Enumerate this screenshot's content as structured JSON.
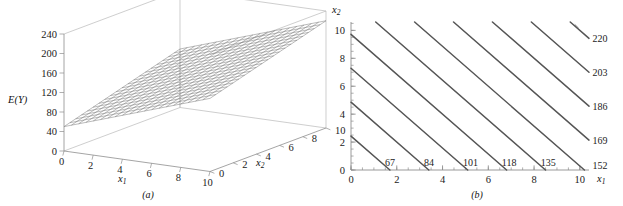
{
  "figure": {
    "panel_a_caption": "(a)",
    "panel_b_caption": "(b)"
  },
  "chart_data": [
    {
      "type": "surface",
      "panel": "(a)",
      "title": "",
      "xlabel": "x1",
      "ylabel": "x2",
      "zlabel": "E(Y)",
      "xlim": [
        0,
        10
      ],
      "ylim": [
        0,
        10
      ],
      "zlim": [
        0,
        240
      ],
      "xticks": [
        0,
        2,
        4,
        6,
        8,
        10
      ],
      "yticks": [
        0,
        2,
        4,
        6,
        8,
        10
      ],
      "zticks": [
        0,
        40,
        80,
        120,
        160,
        200,
        240
      ],
      "xtick_labels": [
        "0",
        "2",
        "4",
        "6",
        "8",
        "10"
      ],
      "ytick_labels": [
        "0",
        "2",
        "4",
        "6",
        "8",
        "10"
      ],
      "ztick_labels": [
        "0",
        "40",
        "80",
        "120",
        "160",
        "200",
        "240"
      ],
      "surface_style": "wireframe-mesh",
      "mesh_divisions": 20,
      "grid": false,
      "equation": "E(Y) = 50 + 10*x1 + 7*x2",
      "corner_values": {
        "x1_0_x2_0": 50,
        "x1_10_x2_0": 150,
        "x1_0_x2_10": 120,
        "x1_10_x2_10": 220
      }
    },
    {
      "type": "contour",
      "panel": "(b)",
      "title": "",
      "xlabel": "x1",
      "ylabel": "x2",
      "xlim": [
        0,
        10.4
      ],
      "ylim": [
        0,
        10.6
      ],
      "xticks": [
        0,
        2,
        4,
        6,
        8,
        10
      ],
      "yticks": [
        0,
        2,
        4,
        6,
        8,
        10
      ],
      "xtick_labels": [
        "0",
        "2",
        "4",
        "6",
        "8",
        "10"
      ],
      "ytick_labels": [
        "0",
        "2",
        "4",
        "6",
        "8",
        "10"
      ],
      "minor_tick_step": 0.5,
      "grid": false,
      "equation": "E(Y) = 50 + 10*x1 + 7*x2",
      "level_step": 17,
      "levels": [
        67,
        84,
        101,
        118,
        135,
        152,
        169,
        186,
        203,
        220
      ],
      "line_color": "#555555",
      "contours": [
        {
          "level": 67,
          "label": "67",
          "label_pos": "bottom",
          "x_at_y0": 1.7,
          "y_at_x0": 2.43
        },
        {
          "level": 84,
          "label": "84",
          "label_pos": "bottom",
          "x_at_y0": 3.4,
          "y_at_x0": 4.86
        },
        {
          "level": 101,
          "label": "101",
          "label_pos": "bottom",
          "x_at_y0": 5.1,
          "y_at_x0": 7.29
        },
        {
          "level": 118,
          "label": "118",
          "label_pos": "bottom",
          "x_at_y0": 6.8,
          "y_at_x0": 9.71
        },
        {
          "level": 135,
          "label": "135",
          "label_pos": "bottom",
          "x_at_y0": 8.5,
          "y_at_x0": 12.14
        },
        {
          "level": 152,
          "label": "152",
          "label_pos": "bottom-right",
          "x_at_y0": 10.2,
          "y_at_x0": 14.57
        },
        {
          "level": 169,
          "label": "169",
          "label_pos": "right",
          "x_at_y0": 11.9,
          "y_at_x0": 17.0
        },
        {
          "level": 186,
          "label": "186",
          "label_pos": "right",
          "x_at_y0": 13.6,
          "y_at_x0": 19.43
        },
        {
          "level": 203,
          "label": "203",
          "label_pos": "right",
          "x_at_y0": 15.3,
          "y_at_x0": 21.86
        },
        {
          "level": 220,
          "label": "220",
          "label_pos": "right",
          "x_at_y0": 17.0,
          "y_at_x0": 24.29
        }
      ]
    }
  ]
}
